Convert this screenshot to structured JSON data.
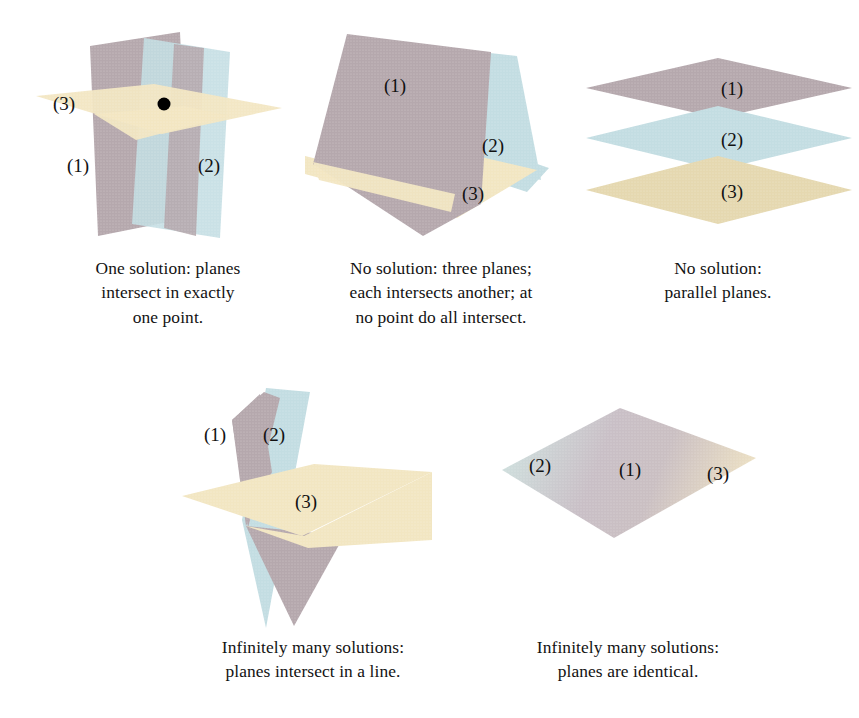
{
  "page": {
    "background_color": "#ffffff"
  },
  "colors": {
    "plane_mauve": "#b5a8ad",
    "plane_blue": "#c3dde2",
    "plane_cream": "#f2e6c2",
    "point_marker": "#000000",
    "text": "#121212"
  },
  "plane_labels": {
    "one": "(1)",
    "two": "(2)",
    "three": "(3)"
  },
  "figures": [
    {
      "id": "one-solution",
      "caption_lines": [
        "One solution: planes",
        "intersect in exactly",
        "one point."
      ],
      "labels": {
        "plane1": "(1)",
        "plane2": "(2)",
        "plane3": "(3)"
      },
      "marker": "intersection-point"
    },
    {
      "id": "no-solution-three-planes",
      "caption_lines": [
        "No solution: three planes;",
        "each intersects another; at",
        "no point do all intersect."
      ],
      "labels": {
        "plane1": "(1)",
        "plane2": "(2)",
        "plane3": "(3)"
      }
    },
    {
      "id": "parallel-planes",
      "caption_lines": [
        "No solution:",
        "parallel planes."
      ],
      "labels": {
        "plane1": "(1)",
        "plane2": "(2)",
        "plane3": "(3)"
      }
    },
    {
      "id": "line-intersection",
      "caption_lines": [
        "Infinitely many solutions:",
        "planes intersect in a line."
      ],
      "labels": {
        "plane1": "(1)",
        "plane2": "(2)",
        "plane3": "(3)"
      }
    },
    {
      "id": "identical-planes",
      "caption_lines": [
        "Infinitely many solutions:",
        "planes are identical."
      ],
      "labels": {
        "plane1": "(1)",
        "plane2": "(2)",
        "plane3": "(3)"
      }
    }
  ]
}
